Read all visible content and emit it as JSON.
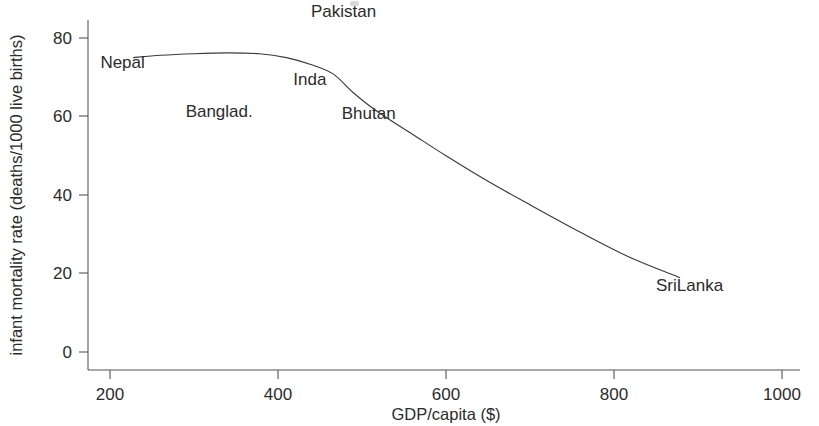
{
  "figure": {
    "background_color": "#ffffff",
    "ink_color": "#2b2b2b",
    "curve_color": "#3a3a3a",
    "axis_color": "#555555"
  },
  "chart_data": {
    "type": "line",
    "title": "",
    "subtitle": "",
    "xlabel": "GDP/capita ($)",
    "ylabel": "infant mortality rate (deaths/1000 live births)",
    "xlim": [
      150,
      1025
    ],
    "ylim": [
      -4,
      88
    ],
    "xticks": [
      200,
      400,
      600,
      800,
      1000
    ],
    "xtick_labels": [
      "200",
      "400",
      "600",
      "800",
      "1000"
    ],
    "yticks": [
      0,
      20,
      40,
      60,
      80
    ],
    "ytick_labels": [
      "0",
      "20",
      "40",
      "60",
      "80"
    ],
    "grid": false,
    "legend": "none",
    "series": [
      {
        "name": "infant mortality vs GDP/capita",
        "x": [
          228,
          260,
          300,
          340,
          378,
          410,
          440,
          466,
          490,
          520,
          560,
          600,
          650,
          700,
          760,
          820,
          878
        ],
        "y": [
          75.0,
          75.6,
          76.0,
          76.2,
          76.0,
          75.0,
          73.2,
          70.8,
          66.0,
          61.0,
          55.5,
          50.0,
          43.5,
          37.5,
          30.5,
          24.0,
          19.0
        ]
      }
    ],
    "annotations": [
      {
        "label": "Nepal",
        "x": 215,
        "y": 74.0
      },
      {
        "label": "Banglad.",
        "x": 330,
        "y": 61.5
      },
      {
        "label": "Pakistan",
        "x": 478,
        "y": 87.0
      },
      {
        "label": "Inda",
        "x": 438,
        "y": 69.5
      },
      {
        "label": "Bhutan",
        "x": 508,
        "y": 61.0
      },
      {
        "label": "SriLanka",
        "x": 890,
        "y": 17.0
      }
    ]
  },
  "axes": {
    "x_title": "GDP/capita ($)",
    "y_title": "infant mortality rate (deaths/1000 live births)"
  }
}
